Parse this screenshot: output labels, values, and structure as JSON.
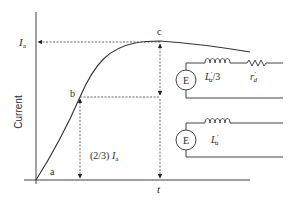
{
  "diagram": {
    "y_axis_label": "Current",
    "x_axis_label": "t",
    "ia_label_main": "I",
    "ia_label_sub": "a",
    "points": {
      "a": "a",
      "b": "b",
      "c": "c"
    },
    "two_thirds_prefix": "(2/3) ",
    "two_thirds_main": "I",
    "two_thirds_sub": "a",
    "circuit_upper": {
      "source_label": "E",
      "inductor_main": "L",
      "inductor_sup": "′",
      "inductor_sub": "a",
      "inductor_suffix": "/3",
      "resistor_main": "r",
      "resistor_sup": "′",
      "resistor_sub": "d"
    },
    "circuit_lower": {
      "source_label": "E",
      "inductor_main": "L",
      "inductor_sup": "′",
      "inductor_sub": "a"
    },
    "colors": {
      "line": "#444444",
      "text": "#2a2a2a",
      "background": "#ffffff"
    }
  }
}
